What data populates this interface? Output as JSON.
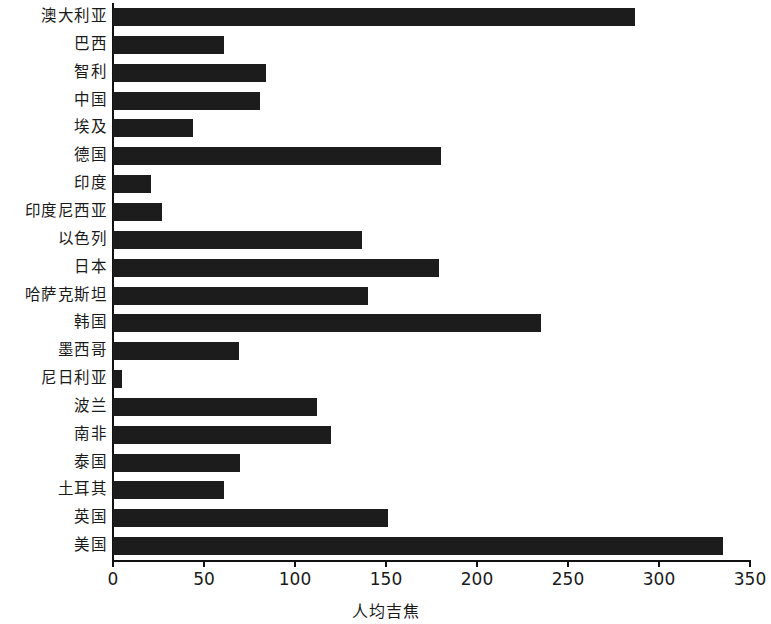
{
  "chart_data": {
    "type": "bar",
    "orientation": "horizontal",
    "title": "",
    "subtitle": "",
    "xlabel": "人均吉焦",
    "ylabel": "",
    "xlim": [
      0,
      350
    ],
    "xticks": [
      0,
      50,
      100,
      150,
      200,
      250,
      300,
      350
    ],
    "xtick_labels": [
      "0",
      "50",
      "100",
      "150",
      "200",
      "250",
      "300",
      "350"
    ],
    "grid": false,
    "legend": null,
    "bar_color": "#1c1c1c",
    "background_color": "#ffffff",
    "axis_color": "#111111",
    "categories": [
      "澳大利亚",
      "巴西",
      "智利",
      "中国",
      "埃及",
      "德国",
      "印度",
      "印度尼西亚",
      "以色列",
      "日本",
      "哈萨克斯坦",
      "韩国",
      "墨西哥",
      "尼日利亚",
      "波兰",
      "南非",
      "泰国",
      "土耳其",
      "英国",
      "美国"
    ],
    "values": [
      287,
      61,
      84,
      81,
      44,
      180,
      21,
      27,
      137,
      179,
      140,
      235,
      69,
      5,
      112,
      120,
      70,
      61,
      151,
      335
    ]
  }
}
